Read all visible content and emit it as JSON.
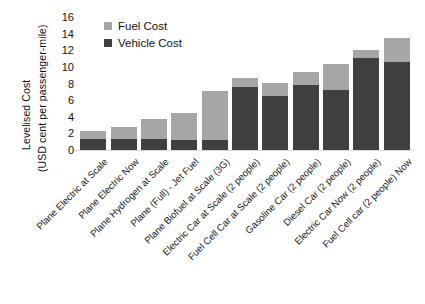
{
  "chart_data": {
    "type": "bar",
    "stacked": true,
    "title": "",
    "xlabel": "",
    "ylabel": "Levelised Cost (USD cent per passenger-mile)",
    "ylim": [
      0,
      16
    ],
    "ytick_labels": [
      "16",
      "14",
      "12",
      "10",
      "8",
      "6",
      "4",
      "2",
      "0"
    ],
    "ytick_values": [
      16,
      14,
      12,
      10,
      8,
      6,
      4,
      2,
      0
    ],
    "grid": false,
    "legend_position": "top-left-inside",
    "categories": [
      "Plane Electric at Scale",
      "Plane Electric Now",
      "Plane Hydrogen at Scale",
      "Plane (Full) - Jet Fuel",
      "Plane Biofuel at Scale (3G)",
      "Electric Car at Scale (2 people)",
      "Fuel Cell Car at Scale (2 people)",
      "Gasoline Car (2 people)",
      "Diesel Car (2 people)",
      "Electric Car Now (2 people)",
      "Fuel Cell car (2 people) Now"
    ],
    "series": [
      {
        "name": "Vehicle Cost",
        "color": "#404040",
        "values": [
          1.3,
          1.3,
          1.3,
          1.2,
          1.2,
          7.6,
          6.5,
          7.8,
          7.2,
          11.1,
          10.6
        ]
      },
      {
        "name": "Fuel Cost",
        "color": "#a6a6a6",
        "values": [
          1.0,
          1.5,
          2.4,
          3.3,
          5.9,
          1.1,
          1.6,
          1.6,
          3.2,
          0.9,
          2.9
        ]
      }
    ],
    "totals": [
      2.3,
      2.8,
      3.7,
      4.5,
      7.1,
      8.7,
      8.1,
      9.4,
      10.4,
      12.0,
      13.5
    ]
  },
  "ylabel_lines": {
    "line1": "Levelised Cost",
    "line2": "(USD cent per passenger-mile)"
  },
  "legend": {
    "items": [
      {
        "label": "Fuel Cost",
        "color": "#a6a6a6"
      },
      {
        "label": "Vehicle Cost",
        "color": "#404040"
      }
    ]
  }
}
